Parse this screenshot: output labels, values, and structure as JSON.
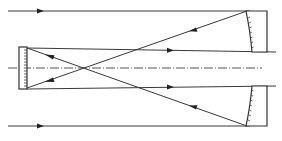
{
  "diagram": {
    "type": "Cassegrain-style reflecting telescope ray diagram",
    "colors": {
      "line": "#3a3a3a",
      "axis": "#555555",
      "background": "#ffffff"
    },
    "elements": {
      "incoming_rays": 2,
      "optical_axis": "dash-dot",
      "primary_mirror": "concave, split into upper and lower halves (right side)",
      "secondary_mirror": "flat, hatched (left side)"
    }
  }
}
